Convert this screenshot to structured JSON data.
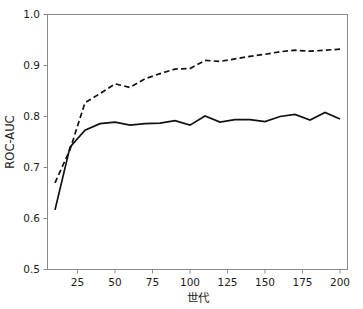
{
  "chart_data": {
    "type": "line",
    "title": "",
    "xlabel": "世代",
    "ylabel": "ROC-AUC",
    "xlim": [
      5,
      205
    ],
    "ylim": [
      0.5,
      1.0
    ],
    "grid": false,
    "legend": "none",
    "x_ticks": [
      25,
      50,
      75,
      100,
      125,
      150,
      175,
      200
    ],
    "x_tick_labels": [
      "25",
      "50",
      "75",
      "100",
      "125",
      "150",
      "175",
      "200"
    ],
    "y_ticks": [
      0.5,
      0.6,
      0.7,
      0.8,
      0.9,
      1.0
    ],
    "y_tick_labels": [
      "0.5",
      "0.6",
      "0.7",
      "0.8",
      "0.9",
      "1.0"
    ],
    "x": [
      10,
      20,
      30,
      40,
      50,
      60,
      70,
      80,
      90,
      100,
      110,
      120,
      130,
      140,
      150,
      160,
      170,
      180,
      190,
      200
    ],
    "series": [
      {
        "name": "solid-series",
        "style": "solid",
        "color": "#111111",
        "values": [
          0.617,
          0.74,
          0.773,
          0.786,
          0.789,
          0.783,
          0.786,
          0.787,
          0.792,
          0.783,
          0.801,
          0.789,
          0.794,
          0.794,
          0.79,
          0.8,
          0.804,
          0.793,
          0.808,
          0.795
        ]
      },
      {
        "name": "dashed-series",
        "style": "dashed",
        "color": "#111111",
        "values": [
          0.67,
          0.735,
          0.827,
          0.845,
          0.864,
          0.857,
          0.874,
          0.884,
          0.893,
          0.894,
          0.91,
          0.908,
          0.913,
          0.918,
          0.922,
          0.927,
          0.93,
          0.928,
          0.93,
          0.932
        ]
      }
    ]
  },
  "axes": {
    "x_axis_name": "世代",
    "y_axis_name": "ROC-AUC"
  }
}
